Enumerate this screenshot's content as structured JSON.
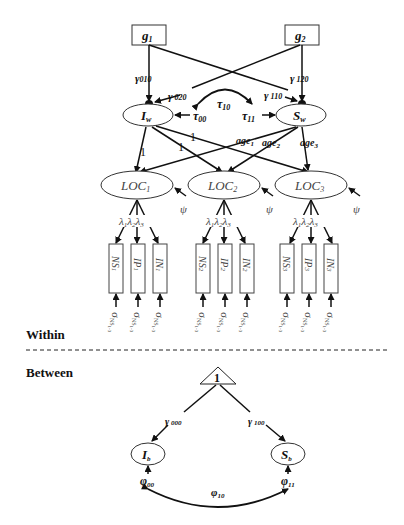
{
  "sections": {
    "within": "Within",
    "between": "Between"
  },
  "within": {
    "predictors": [
      {
        "name": "g",
        "sub": "1"
      },
      {
        "name": "g",
        "sub": "2"
      }
    ],
    "paths": {
      "g1_to_Iw": {
        "name": "γ",
        "sub": "010"
      },
      "g2_to_Iw": {
        "name": "γ",
        "sub": " 020"
      },
      "g1_to_Sw": {
        "name": "γ",
        "sub": " 110"
      },
      "g2_to_Sw": {
        "name": "γ",
        "sub": " 120"
      }
    },
    "covariance": {
      "name": "τ",
      "sub": "10"
    },
    "variances": {
      "Iw": {
        "name": "τ",
        "sub": "00"
      },
      "Sw": {
        "name": "τ",
        "sub": "11"
      }
    },
    "growth_factors": [
      {
        "name": "I",
        "sub": "w"
      },
      {
        "name": "S",
        "sub": "w"
      }
    ],
    "intercept_loadings": [
      "1",
      "1",
      "1"
    ],
    "slope_loadings": [
      {
        "name": "age",
        "sub": "1"
      },
      {
        "name": "age",
        "sub": "2"
      },
      {
        "name": "age",
        "sub": "3"
      }
    ],
    "latent": [
      {
        "name": "LOC",
        "sub": "1"
      },
      {
        "name": "LOC",
        "sub": "2"
      },
      {
        "name": "LOC",
        "sub": "3"
      }
    ],
    "residual_label": "ψ",
    "factor_loadings": [
      {
        "name": "λ",
        "sub": "1"
      },
      {
        "name": "λ",
        "sub": "2"
      },
      {
        "name": "λ",
        "sub": "3"
      }
    ],
    "indicators": [
      [
        {
          "name": "NS",
          "sub": "1"
        },
        {
          "name": "IP",
          "sub": "1"
        },
        {
          "name": "IN",
          "sub": "1"
        }
      ],
      [
        {
          "name": "NS",
          "sub": "2"
        },
        {
          "name": "IP",
          "sub": "2"
        },
        {
          "name": "IN",
          "sub": "2"
        }
      ],
      [
        {
          "name": "NS",
          "sub": "3"
        },
        {
          "name": "IP",
          "sub": "3"
        },
        {
          "name": "IN",
          "sub": "3"
        }
      ]
    ],
    "indicator_error": {
      "name": "σ",
      "sub": "NS",
      "subsub": "1-3"
    }
  },
  "between": {
    "constant": "1",
    "paths": {
      "to_Ib": {
        "name": "γ",
        "sub": " 000"
      },
      "to_Sb": {
        "name": "γ",
        "sub": " 100"
      }
    },
    "growth_factors": [
      {
        "name": "I",
        "sub": "b"
      },
      {
        "name": "S",
        "sub": "b"
      }
    ],
    "variances": {
      "Ib": {
        "name": "φ",
        "sub": "00"
      },
      "Sb": {
        "name": "φ",
        "sub": "11"
      }
    },
    "covariance": {
      "name": "φ",
      "sub": "10"
    }
  }
}
